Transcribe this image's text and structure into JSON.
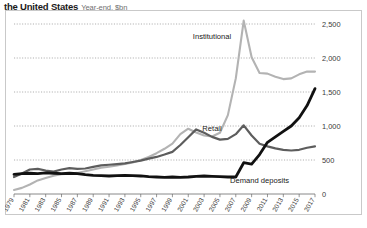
{
  "header": {
    "title": "the United States",
    "subtitle": "Year-end, $bn"
  },
  "chart_data": {
    "type": "line",
    "title": "the United States",
    "subtitle": "Year-end, $bn",
    "xlabel": "",
    "ylabel": "",
    "unit": "$bn",
    "grid": true,
    "legend_position": "inline-annotation",
    "ylim": [
      0,
      2500
    ],
    "yticks": [
      0,
      500,
      1000,
      1500,
      2000,
      2500
    ],
    "ytick_labels": [
      "0",
      "500",
      "1,000",
      "1,500",
      "2,000",
      "2,500"
    ],
    "xlim": [
      1979,
      2017
    ],
    "xticks": [
      1979,
      1981,
      1983,
      1985,
      1987,
      1989,
      1991,
      1993,
      1995,
      1997,
      1999,
      2001,
      2003,
      2005,
      2007,
      2009,
      2011,
      2013,
      2015,
      2017
    ],
    "xtick_labels": [
      "1979",
      "1981",
      "1983",
      "1985",
      "1987",
      "1989",
      "1991",
      "1993",
      "1995",
      "1997",
      "1999",
      "2001",
      "2003",
      "2005",
      "2007",
      "2009",
      "2011",
      "2013",
      "2015",
      "2017"
    ],
    "x": [
      1979,
      1980,
      1981,
      1982,
      1983,
      1984,
      1985,
      1986,
      1987,
      1988,
      1989,
      1990,
      1991,
      1992,
      1993,
      1994,
      1995,
      1996,
      1997,
      1998,
      1999,
      2000,
      2001,
      2002,
      2003,
      2004,
      2005,
      2006,
      2007,
      2008,
      2009,
      2010,
      2011,
      2012,
      2013,
      2014,
      2015,
      2016,
      2017
    ],
    "series": [
      {
        "name": "Institutional",
        "color": "#b3b3b3",
        "label_x": 2004,
        "label_y": 2280,
        "values": [
          60,
          90,
          140,
          200,
          235,
          270,
          290,
          300,
          310,
          335,
          360,
          385,
          400,
          420,
          440,
          465,
          500,
          545,
          600,
          665,
          740,
          880,
          960,
          905,
          860,
          845,
          900,
          1160,
          1700,
          2550,
          2010,
          1780,
          1770,
          1725,
          1690,
          1700,
          1760,
          1800,
          1800
        ]
      },
      {
        "name": "Retail",
        "color": "#5d5d5d",
        "label_x": 2004,
        "label_y": 930,
        "values": [
          250,
          300,
          360,
          370,
          345,
          330,
          360,
          380,
          370,
          375,
          400,
          420,
          430,
          440,
          450,
          470,
          490,
          520,
          545,
          580,
          620,
          720,
          835,
          950,
          900,
          840,
          800,
          810,
          880,
          1010,
          860,
          740,
          700,
          670,
          650,
          640,
          650,
          680,
          700
        ]
      },
      {
        "name": "Demand deposits",
        "color": "#111111",
        "label_x": 2010,
        "label_y": 160,
        "values": [
          290,
          300,
          305,
          300,
          310,
          305,
          300,
          305,
          300,
          285,
          275,
          270,
          265,
          270,
          275,
          270,
          265,
          255,
          250,
          245,
          250,
          245,
          250,
          260,
          265,
          260,
          255,
          250,
          250,
          460,
          440,
          580,
          760,
          840,
          920,
          1000,
          1120,
          1300,
          1550
        ]
      }
    ]
  }
}
